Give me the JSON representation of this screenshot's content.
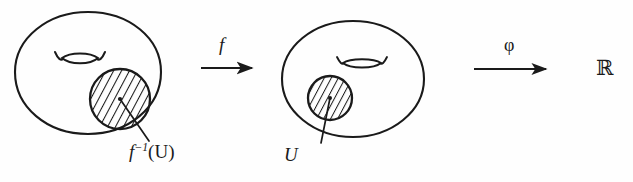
{
  "figure": {
    "kind": "mathematical-diagram",
    "background_color": "#fefefe",
    "ink_color": "#1a1a1a"
  },
  "labels": {
    "preimage": {
      "full_text": "f−1(U)",
      "base": "f",
      "exponent": "−1",
      "argument": "(U)"
    },
    "open_set": "U",
    "map_f": "f",
    "map_phi": "φ",
    "codomain": "ℝ"
  },
  "surfaces": [
    {
      "name": "domain-surface",
      "center_x": 88,
      "center_y": 73,
      "radius_x": 73,
      "radius_y": 61,
      "handle": {
        "center_x": 80,
        "center_y": 59,
        "width": 50,
        "height": 13
      },
      "region": {
        "name": "preimage-disk",
        "center_x": 120,
        "center_y": 99,
        "radius": 30,
        "hatched": true,
        "hatch_angle_deg": -62,
        "has_center_dot": true
      },
      "leader": {
        "x1": 120,
        "y1": 99,
        "x2": 149,
        "y2": 141
      }
    },
    {
      "name": "codomain-surface",
      "center_x": 353,
      "center_y": 79,
      "radius_x": 71,
      "radius_y": 58,
      "handle": {
        "center_x": 362,
        "center_y": 63,
        "width": 42,
        "height": 11
      },
      "region": {
        "name": "open-set-disk",
        "center_x": 330,
        "center_y": 98,
        "radius": 22,
        "hatched": true,
        "hatch_angle_deg": -62,
        "has_center_dot": true
      },
      "leader": {
        "x1": 330,
        "y1": 98,
        "x2": 321,
        "y2": 143
      }
    }
  ],
  "arrows": [
    {
      "name": "arrow-f",
      "label": "f",
      "x1": 201,
      "y1": 68,
      "x2": 254,
      "y2": 68
    },
    {
      "name": "arrow-phi",
      "label": "φ",
      "x1": 474,
      "y1": 69,
      "x2": 548,
      "y2": 69
    }
  ]
}
